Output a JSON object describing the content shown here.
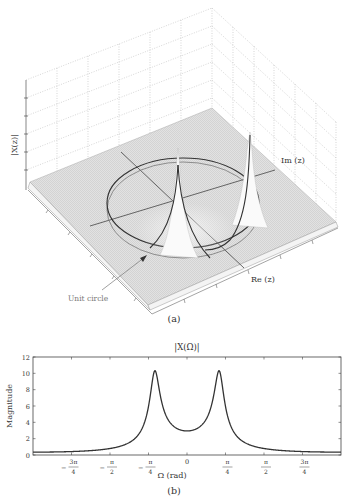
{
  "figure_a": {
    "caption": "(a)",
    "zlabel": "|X(z)|",
    "im_label": "Im (z)",
    "re_label": "Re (z)",
    "annotation": "Unit circle",
    "type": "3d-surface",
    "description": "Magnitude surface |X(z)| over the z-plane with two poles inside near the unit circle; unit circle trace drawn on surface"
  },
  "figure_b": {
    "caption": "(b)",
    "title": "|X(Ω)|",
    "xlabel": "Ω (rad)",
    "ylabel": "Magnitude",
    "yticks": [
      "0",
      "2",
      "4",
      "6",
      "8",
      "10",
      "12"
    ],
    "xticks": [
      {
        "num": "3π",
        "den": "4",
        "sign": "−"
      },
      {
        "num": "π",
        "den": "2",
        "sign": "−"
      },
      {
        "num": "π",
        "den": "4",
        "sign": "−"
      },
      {
        "num": "0",
        "den": "",
        "sign": ""
      },
      {
        "num": "π",
        "den": "4",
        "sign": ""
      },
      {
        "num": "π",
        "den": "2",
        "sign": ""
      },
      {
        "num": "3π",
        "den": "4",
        "sign": ""
      }
    ]
  },
  "chart_data": [
    {
      "type": "line",
      "title": "|X(Ω)|",
      "xlabel": "Ω (rad)",
      "ylabel": "Magnitude",
      "xlim": [
        -3.1416,
        3.1416
      ],
      "ylim": [
        0,
        12
      ],
      "grid": false,
      "x_tick_labels": [
        "-3π/4",
        "-π/2",
        "-π/4",
        "0",
        "π/4",
        "π/2",
        "3π/4"
      ],
      "y_tick_labels": [
        "0",
        "2",
        "4",
        "6",
        "8",
        "10",
        "12"
      ],
      "series": [
        {
          "name": "|X(Ω)|",
          "x": [
            -3.1416,
            -2.356,
            -1.571,
            -1.0,
            -0.8,
            -0.7,
            -0.66,
            -0.6,
            -0.5,
            -0.3,
            0,
            0.3,
            0.5,
            0.6,
            0.66,
            0.7,
            0.8,
            1.0,
            1.571,
            2.356,
            3.1416
          ],
          "values": [
            0.5,
            0.55,
            0.8,
            1.5,
            2.6,
            5.5,
            10.3,
            5.5,
            2.3,
            1.0,
            0.6,
            1.0,
            2.3,
            5.5,
            10.3,
            5.5,
            2.6,
            1.5,
            0.8,
            0.55,
            0.5
          ]
        }
      ],
      "peaks": [
        {
          "x": -0.66,
          "y": 10.3
        },
        {
          "x": 0.66,
          "y": 10.3
        }
      ]
    },
    {
      "type": "surface3d",
      "title": "",
      "zlabel": "|X(z)|",
      "xlabel": "Re (z)",
      "ylabel": "Im (z)",
      "annotations": [
        "Unit circle"
      ],
      "poles_angle_rad": [
        -0.66,
        0.66
      ]
    }
  ]
}
